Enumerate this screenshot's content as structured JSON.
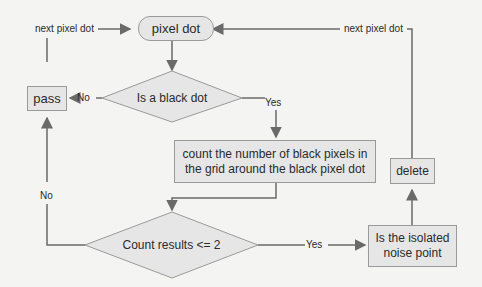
{
  "nodes": {
    "start": "pixel dot",
    "decision_black": "Is a black dot",
    "pass": "pass",
    "count": "count the number of black pixels in the grid around the black pixel dot",
    "decision_count": "Count results <= 2",
    "isolated": "Is the isolated noise point",
    "delete": "delete"
  },
  "edge_labels": {
    "next_left": "next pixel dot",
    "next_right": "next pixel dot",
    "black_no": "No",
    "black_yes": "Yes",
    "count_no": "No",
    "count_yes": "Yes"
  },
  "colors": {
    "node_fill": "#e6e6e6",
    "node_border": "#9a9a9a",
    "line": "#6a6a6a",
    "background": "#f4f4f2"
  }
}
